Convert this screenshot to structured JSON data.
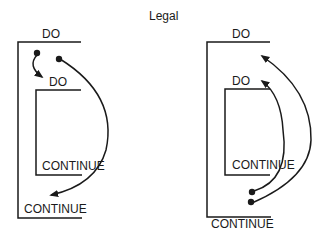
{
  "title": "Legal",
  "left_diagram": {
    "outer_do": "DO",
    "inner_do": "DO",
    "inner_continue": "CONTINUE",
    "outer_continue": "CONTINUE",
    "arrows": [
      {
        "from": "outer loop body start",
        "to": "inner DO",
        "description": "jump from outer loop into start of inner DO"
      },
      {
        "from": "outer loop body",
        "to": "outer CONTINUE",
        "description": "jump from outer loop to outer CONTINUE"
      }
    ]
  },
  "right_diagram": {
    "outer_do": "DO",
    "inner_do": "DO",
    "inner_continue": "CONTINUE",
    "outer_continue": "CONTINUE",
    "arrows": [
      {
        "from": "after inner CONTINUE",
        "to": "inner DO",
        "description": "jump back to inner DO"
      },
      {
        "from": "after inner CONTINUE",
        "to": "outer loop body start",
        "description": "jump back to top of outer loop"
      }
    ]
  },
  "colors": {
    "line": "#1a1a1a",
    "background": "#ffffff"
  }
}
